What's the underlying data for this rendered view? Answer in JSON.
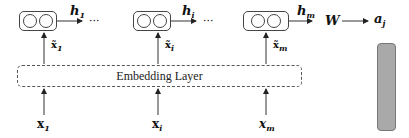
{
  "diagram": {
    "type": "neural-network-architecture",
    "layer_label": "Embedding Layer",
    "rnn_cells": [
      {
        "output_label": "h",
        "output_sub": "1",
        "input_label": "x̃",
        "input_sub": "1"
      },
      {
        "output_label": "h",
        "output_sub": "i",
        "input_label": "x̃",
        "input_sub": "i"
      },
      {
        "output_label": "h",
        "output_sub": "m",
        "input_label": "x̃",
        "input_sub": "m"
      }
    ],
    "inputs": [
      {
        "label": "x",
        "sub": "1"
      },
      {
        "label": "x",
        "sub": "i"
      },
      {
        "label": "x",
        "sub": "m"
      }
    ],
    "ellipsis": "···",
    "weight_label": "W",
    "output_label": "a",
    "output_sub": "j",
    "colors": {
      "stroke": "#444444",
      "output_bar": "#a9a9a9"
    }
  }
}
